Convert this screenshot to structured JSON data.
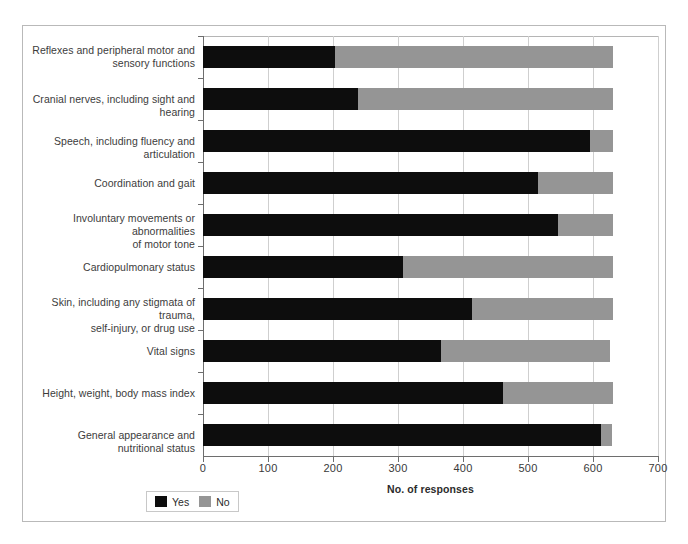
{
  "chart_data": {
    "type": "bar",
    "orientation": "horizontal",
    "stacked": true,
    "title": "",
    "xlabel": "No. of responses",
    "ylabel": "",
    "xlim": [
      0,
      700
    ],
    "xticks": [
      0,
      100,
      200,
      300,
      400,
      500,
      600,
      700
    ],
    "grid": true,
    "legend_position": "bottom-left",
    "categories": [
      "Reflexes and peripheral motor and sensory functions",
      "Cranial nerves, including sight and hearing",
      "Speech, including fluency and articulation",
      "Coordination and gait",
      "Involuntary movements or abnormalities of motor tone",
      "Cardiopulmonary status",
      "Skin, including any stigmata of trauma, self-injury, or drug use",
      "Vital signs",
      "Height, weight, body mass index",
      "General appearance and nutritional status"
    ],
    "series": [
      {
        "name": "Yes",
        "color": "#0d0d0d",
        "values": [
          203,
          238,
          595,
          515,
          546,
          308,
          414,
          366,
          462,
          612
        ]
      },
      {
        "name": "No",
        "color": "#959595",
        "values": [
          428,
          393,
          36,
          116,
          85,
          323,
          217,
          260,
          169,
          17
        ]
      }
    ]
  },
  "categories_display": [
    {
      "line1": "Reflexes and peripheral motor and",
      "line2": "sensory functions"
    },
    {
      "line1": "Cranial nerves, including sight and hearing",
      "line2": ""
    },
    {
      "line1": "Speech, including fluency and articulation",
      "line2": ""
    },
    {
      "line1": "Coordination and gait",
      "line2": ""
    },
    {
      "line1": "Involuntary movements or abnormalities",
      "line2": "of motor tone"
    },
    {
      "line1": "Cardiopulmonary status",
      "line2": ""
    },
    {
      "line1": "Skin, including any stigmata of trauma,",
      "line2": "self-injury, or drug use"
    },
    {
      "line1": "Vital signs",
      "line2": ""
    },
    {
      "line1": "Height, weight, body mass index",
      "line2": ""
    },
    {
      "line1": "General appearance and nutritional status",
      "line2": ""
    }
  ],
  "axis": {
    "tick_labels": [
      "0",
      "100",
      "200",
      "300",
      "400",
      "500",
      "600",
      "700"
    ],
    "title": "No. of responses"
  },
  "legend": {
    "items": [
      {
        "label": "Yes",
        "color": "#0d0d0d"
      },
      {
        "label": "No",
        "color": "#959595"
      }
    ]
  }
}
